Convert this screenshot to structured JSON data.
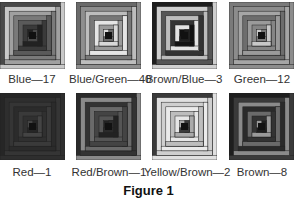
{
  "figure": {
    "caption": "Figure 1",
    "blocks": [
      {
        "label": "Blue—17",
        "x": 0,
        "y": 2,
        "lx": -8,
        "ly": 73,
        "colors": [
          "#4a4a4a",
          "#c8c8c8",
          "#a0a0a0",
          "#7a7a7a",
          "#5a5a5a",
          "#3a3a3a",
          "#222"
        ]
      },
      {
        "label": "Blue/Green—40",
        "x": 76,
        "y": 2,
        "lx": 69,
        "ly": 73,
        "colors": [
          "#6a6a6a",
          "#8e8e8e",
          "#bdbdbd",
          "#777",
          "#e4e4e4",
          "#9a9a9a",
          "#d8d8d8"
        ]
      },
      {
        "label": "Brown/Blue—3",
        "x": 152,
        "y": 2,
        "lx": 144,
        "ly": 73,
        "colors": [
          "#1e1e1e",
          "#cfcfcf",
          "#555",
          "#bcbcbc",
          "#333",
          "#e2e2e2",
          "#111"
        ]
      },
      {
        "label": "Green—12",
        "x": 229,
        "y": 2,
        "lx": 222,
        "ly": 73,
        "colors": [
          "#7a7a7a",
          "#8c8c8c",
          "#a5a5a5",
          "#6d6d6d",
          "#9a9a9a",
          "#858585",
          "#c8c8c8"
        ]
      },
      {
        "label": "Red—1",
        "x": 0,
        "y": 93,
        "lx": -8,
        "ly": 166,
        "colors": [
          "#262626",
          "#2e2e2e",
          "#353535",
          "#2b2b2b",
          "#3a3a3a",
          "#303030",
          "#444"
        ]
      },
      {
        "label": "Red/Brown—1",
        "x": 76,
        "y": 93,
        "lx": 69,
        "ly": 166,
        "colors": [
          "#2a2a2a",
          "#8a8a8a",
          "#333",
          "#6a6a6a",
          "#444",
          "#555",
          "#222"
        ]
      },
      {
        "label": "Yellow/Brown—2",
        "x": 152,
        "y": 93,
        "lx": 144,
        "ly": 166,
        "colors": [
          "#3a3a3a",
          "#e0e0e0",
          "#cfcfcf",
          "#eaeaea",
          "#bdbdbd",
          "#e6e6e6",
          "#aaa"
        ]
      },
      {
        "label": "Brown—8",
        "x": 229,
        "y": 93,
        "lx": 222,
        "ly": 166,
        "colors": [
          "#1e1e1e",
          "#3a3a3a",
          "#8a8a8a",
          "#2a2a2a",
          "#6a6a6a",
          "#333",
          "#999"
        ]
      }
    ]
  }
}
